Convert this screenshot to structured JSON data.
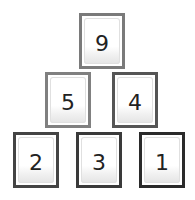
{
  "puzzle": {
    "type": "number-pyramid",
    "rows": [
      {
        "tiles": [
          {
            "value": "9",
            "border": "#7a7a7a",
            "x": 79,
            "y": 13,
            "w": 46,
            "h": 56
          }
        ]
      },
      {
        "tiles": [
          {
            "value": "5",
            "border": "#808080",
            "x": 45,
            "y": 72,
            "w": 46,
            "h": 56
          },
          {
            "value": "4",
            "border": "#555555",
            "x": 112,
            "y": 72,
            "w": 46,
            "h": 56
          }
        ]
      },
      {
        "tiles": [
          {
            "value": "2",
            "border": "#444444",
            "x": 13,
            "y": 132,
            "w": 46,
            "h": 56
          },
          {
            "value": "3",
            "border": "#3a3a3a",
            "x": 76,
            "y": 132,
            "w": 46,
            "h": 56
          },
          {
            "value": "1",
            "border": "#2a2a2a",
            "x": 139,
            "y": 132,
            "w": 46,
            "h": 56
          }
        ]
      }
    ]
  }
}
